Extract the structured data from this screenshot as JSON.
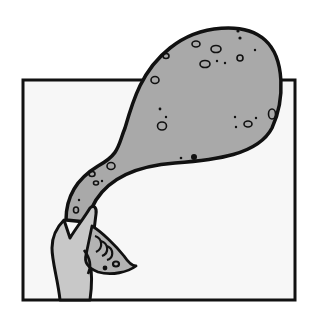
{
  "illustration": {
    "description": "Cartoon of a hand holding a conch shell from which a large grey speckled blob-shaped cloud emerges, overlapping a square frame",
    "colors": {
      "background": "#ffffff",
      "frame_fill": "#f7f7f7",
      "outline": "#111111",
      "blob_fill": "#a9a9a9",
      "hand_fill": "#c8c8c8",
      "shell_fill": "#b3b3b3"
    },
    "elements": [
      "square-frame",
      "speckled-blob",
      "hand",
      "conch-shell"
    ]
  }
}
